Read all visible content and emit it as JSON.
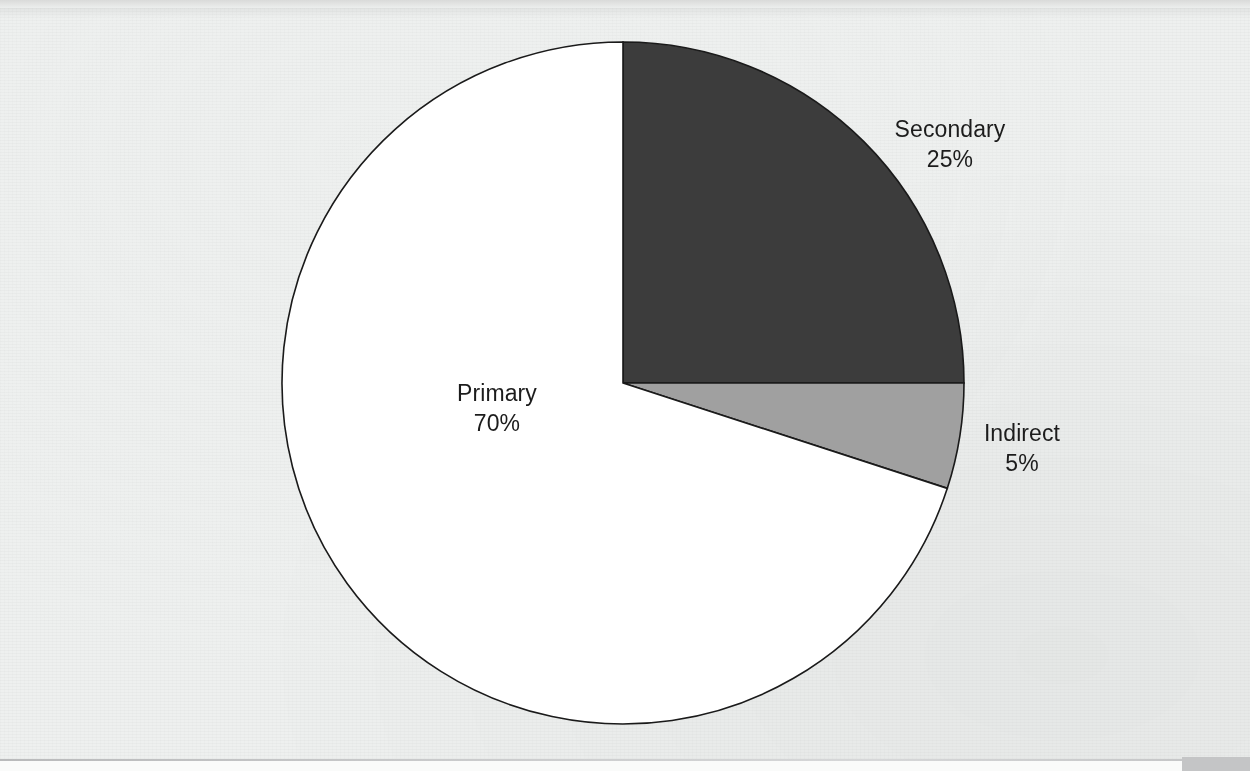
{
  "page": {
    "background_color": "#eef0ef",
    "footer_rule_color": "#c2c3c4",
    "footer_block_color": "#c4c5c6"
  },
  "chart_data": {
    "type": "pie",
    "title": "",
    "subtitle": "",
    "xlabel": "",
    "ylabel": "",
    "legend_position": "none",
    "grid": false,
    "labels_on_slices": false,
    "start_angle_deg": 0,
    "direction": "clockwise",
    "center": {
      "x": 623,
      "y": 383
    },
    "radius": 341,
    "categories": [
      "Secondary",
      "Indirect",
      "Primary"
    ],
    "values": [
      25,
      5,
      70
    ],
    "value_unit": "%",
    "slices": [
      {
        "name": "Secondary",
        "value": 25,
        "value_label": "25%",
        "color": "#3c3c3c",
        "start_angle_deg": 0,
        "end_angle_deg": 90
      },
      {
        "name": "Indirect",
        "value": 5,
        "value_label": "5%",
        "color": "#a0a0a0",
        "start_angle_deg": 90,
        "end_angle_deg": 108
      },
      {
        "name": "Primary",
        "value": 70,
        "value_label": "70%",
        "color": "#ffffff",
        "start_angle_deg": 108,
        "end_angle_deg": 360
      }
    ],
    "stroke_color": "#1a1a1a",
    "stroke_width": 1.6
  },
  "labels": {
    "primary": {
      "name": "Primary",
      "value": "70%"
    },
    "secondary": {
      "name": "Secondary",
      "value": "25%"
    },
    "indirect": {
      "name": "Indirect",
      "value": "5%"
    }
  }
}
